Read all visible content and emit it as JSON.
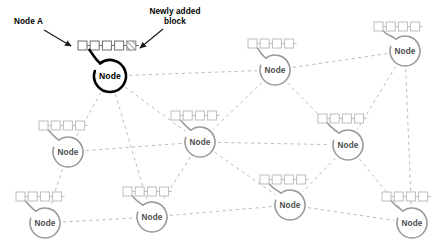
{
  "diagram": {
    "background_color": "#ffffff",
    "highlight_color": "#000000",
    "peer_color": "#9a9a9a",
    "edge_color": "#b4b4b4",
    "block_color": "#bdbdbd",
    "hatch_color": "#8c8c8c"
  },
  "annotations": [
    {
      "id": "node-a",
      "text": "Node A",
      "lines": [
        "Node A"
      ],
      "x": 14,
      "y": 17,
      "arrow": {
        "x1": 44,
        "y1": 30,
        "x2": 71,
        "y2": 46
      }
    },
    {
      "id": "newly-added-block",
      "text": "Newly added block",
      "lines": [
        "Newly added",
        "block"
      ],
      "x": 139,
      "y": 7,
      "arrow": {
        "x1": 163,
        "y1": 29,
        "x2": 140,
        "y2": 48
      }
    }
  ],
  "nodes": [
    {
      "id": "node-a",
      "label": "Node",
      "cx": 110,
      "cy": 76,
      "r": 16,
      "highlight": true,
      "blocks": 5,
      "new_block": true,
      "chain_x": 78,
      "chain_y": 41
    },
    {
      "id": "node-b",
      "label": "Node",
      "cx": 275,
      "cy": 70,
      "r": 15,
      "highlight": false,
      "blocks": 4,
      "new_block": false,
      "chain_x": 248,
      "chain_y": 39
    },
    {
      "id": "node-c",
      "label": "Node",
      "cx": 405,
      "cy": 51,
      "r": 15,
      "highlight": false,
      "blocks": 4,
      "new_block": false,
      "chain_x": 374,
      "chain_y": 22
    },
    {
      "id": "node-d",
      "label": "Node",
      "cx": 68,
      "cy": 152,
      "r": 15,
      "highlight": false,
      "blocks": 4,
      "new_block": false,
      "chain_x": 39,
      "chain_y": 121
    },
    {
      "id": "node-e",
      "label": "Node",
      "cx": 200,
      "cy": 142,
      "r": 15,
      "highlight": false,
      "blocks": 4,
      "new_block": false,
      "chain_x": 171,
      "chain_y": 111
    },
    {
      "id": "node-f",
      "label": "Node",
      "cx": 348,
      "cy": 145,
      "r": 15,
      "highlight": false,
      "blocks": 4,
      "new_block": false,
      "chain_x": 318,
      "chain_y": 114
    },
    {
      "id": "node-g",
      "label": "Node",
      "cx": 45,
      "cy": 223,
      "r": 15,
      "highlight": false,
      "blocks": 4,
      "new_block": false,
      "chain_x": 16,
      "chain_y": 192
    },
    {
      "id": "node-h",
      "label": "Node",
      "cx": 152,
      "cy": 217,
      "r": 15,
      "highlight": false,
      "blocks": 4,
      "new_block": false,
      "chain_x": 123,
      "chain_y": 187
    },
    {
      "id": "node-i",
      "label": "Node",
      "cx": 290,
      "cy": 205,
      "r": 15,
      "highlight": false,
      "blocks": 4,
      "new_block": false,
      "chain_x": 260,
      "chain_y": 175
    },
    {
      "id": "node-j",
      "label": "Node",
      "cx": 412,
      "cy": 223,
      "r": 15,
      "highlight": false,
      "blocks": 4,
      "new_block": false,
      "chain_x": 382,
      "chain_y": 192
    }
  ],
  "edges": [
    {
      "from": "node-a",
      "to": "node-b"
    },
    {
      "from": "node-a",
      "to": "node-d"
    },
    {
      "from": "node-a",
      "to": "node-e"
    },
    {
      "from": "node-a",
      "to": "node-h"
    },
    {
      "from": "node-b",
      "to": "node-c"
    },
    {
      "from": "node-b",
      "to": "node-e"
    },
    {
      "from": "node-b",
      "to": "node-f"
    },
    {
      "from": "node-c",
      "to": "node-f"
    },
    {
      "from": "node-c",
      "to": "node-j"
    },
    {
      "from": "node-d",
      "to": "node-e"
    },
    {
      "from": "node-d",
      "to": "node-g"
    },
    {
      "from": "node-e",
      "to": "node-f"
    },
    {
      "from": "node-e",
      "to": "node-h"
    },
    {
      "from": "node-e",
      "to": "node-i"
    },
    {
      "from": "node-f",
      "to": "node-i"
    },
    {
      "from": "node-f",
      "to": "node-j"
    },
    {
      "from": "node-g",
      "to": "node-h"
    },
    {
      "from": "node-h",
      "to": "node-i"
    },
    {
      "from": "node-i",
      "to": "node-j"
    }
  ]
}
